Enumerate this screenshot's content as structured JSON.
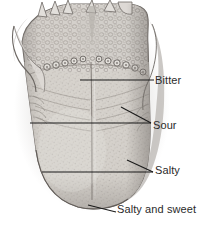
{
  "figure": {
    "background_color": "#ffffff",
    "text_color": "#2b2b2b",
    "leader_line_color": "#1a1a1a"
  },
  "labels": [
    {
      "id": "bitter",
      "text": "Bitter",
      "x": 155,
      "y": 74
    },
    {
      "id": "sour",
      "text": "Sour",
      "x": 153,
      "y": 119
    },
    {
      "id": "salty",
      "text": "Salty",
      "x": 155,
      "y": 164
    },
    {
      "id": "salty-sweet",
      "text": "Salty and sweet",
      "x": 117,
      "y": 203
    }
  ],
  "leaders": {
    "bitter": [
      {
        "x1": 80,
        "y1": 80,
        "x2": 154,
        "y2": 80
      }
    ],
    "sour": [
      {
        "x1": 30,
        "y1": 123,
        "x2": 151,
        "y2": 123
      },
      {
        "x1": 121,
        "y1": 107,
        "x2": 151,
        "y2": 123
      }
    ],
    "salty": [
      {
        "x1": 42,
        "y1": 172,
        "x2": 153,
        "y2": 172
      },
      {
        "x1": 127,
        "y1": 160,
        "x2": 153,
        "y2": 172
      }
    ],
    "salty-sweet": [
      {
        "x1": 88,
        "y1": 205,
        "x2": 116,
        "y2": 212
      }
    ]
  },
  "anatomy": {
    "tongue_fill": "#cfcbc6",
    "tongue_shadow": "#9a9591",
    "tongue_highlight": "#e6e3df",
    "outline": "#5c5854",
    "parts": [
      {
        "name": "lingual-tonsils",
        "region": "posterior-dorsum"
      },
      {
        "name": "circumvallate-papillae",
        "region": "terminal-sulcus-v-row"
      },
      {
        "name": "median-sulcus",
        "region": "midline"
      },
      {
        "name": "filiform-papillae",
        "region": "anterior-dorsum"
      },
      {
        "name": "palatoglossal-arch",
        "region": "lateral-left-and-right"
      },
      {
        "name": "epiglottis-tips",
        "region": "superior-margin"
      },
      {
        "name": "apex",
        "region": "tip"
      }
    ]
  }
}
